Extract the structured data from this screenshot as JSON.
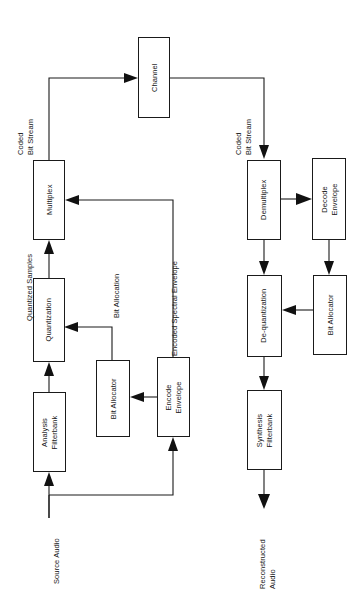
{
  "diagram": {
    "orientation": "rotated-90-ccw",
    "blocks": [
      {
        "id": "channel",
        "line1": "Channel",
        "line2": ""
      },
      {
        "id": "multiplex",
        "line1": "Multiplex",
        "line2": ""
      },
      {
        "id": "quantization",
        "line1": "Quantization",
        "line2": ""
      },
      {
        "id": "analysis",
        "line1": "Analysis",
        "line2": "Filterbank"
      },
      {
        "id": "bit-allocator-enc",
        "line1": "Bit Allocator",
        "line2": ""
      },
      {
        "id": "encode-envelope",
        "line1": "Encode",
        "line2": "Envelope"
      },
      {
        "id": "demultiplex",
        "line1": "Demultiplex",
        "line2": ""
      },
      {
        "id": "decode-envelope",
        "line1": "Decode",
        "line2": "Envelope"
      },
      {
        "id": "dequantization",
        "line1": "De-quantization",
        "line2": ""
      },
      {
        "id": "bit-allocator-dec",
        "line1": "Bit Allocator",
        "line2": ""
      },
      {
        "id": "synthesis",
        "line1": "Synthesis",
        "line2": "Filterbank"
      }
    ],
    "labels": [
      {
        "id": "coded-bit-stream-enc",
        "line1": "Coded",
        "line2": "Bit Stream"
      },
      {
        "id": "coded-bit-stream-dec",
        "line1": "Coded",
        "line2": "Bit Stream"
      },
      {
        "id": "quantized-samples",
        "line1": "Quantized Samples",
        "line2": ""
      },
      {
        "id": "bit-allocation",
        "line1": "Bit Allocation",
        "line2": ""
      },
      {
        "id": "encoded-spectral-envelope",
        "line1": "Encoded Spectral Envelope",
        "line2": ""
      },
      {
        "id": "source-audio",
        "line1": "Source Audio",
        "line2": ""
      },
      {
        "id": "reconstructed-audio",
        "line1": "Reconstructed",
        "line2": "Audio"
      }
    ],
    "colors": {
      "stroke": "#1a1a1a",
      "text": "#161616",
      "background": "#ffffff"
    }
  }
}
